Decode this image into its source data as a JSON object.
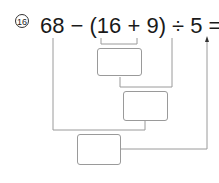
{
  "problem": {
    "number_label": "16",
    "expression": "68 − (16 + 9) ÷ 5 =",
    "tokens": [
      "68",
      "−",
      "(",
      "16",
      "+",
      "9",
      ")",
      "÷",
      "5",
      "="
    ]
  },
  "answer_boxes": [
    {
      "id": "step1",
      "represents": "16 + 9",
      "value": ""
    },
    {
      "id": "step2",
      "represents": "(16 + 9) ÷ 5",
      "value": ""
    },
    {
      "id": "step3",
      "represents": "68 − (16 + 9) ÷ 5",
      "value": ""
    }
  ],
  "colors": {
    "text": "#1a1a1a",
    "lines": "#9a9a9a"
  }
}
